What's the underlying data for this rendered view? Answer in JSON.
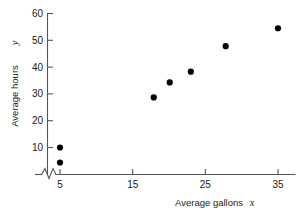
{
  "chart_data": {
    "type": "scatter",
    "title": "",
    "xlabel": "Average gallons",
    "xlabel_var": "x",
    "ylabel": "Average hours",
    "ylabel_var": "y",
    "xlim": [
      2.5,
      37
    ],
    "ylim": [
      0,
      62
    ],
    "xticks": [
      5,
      15,
      25,
      35
    ],
    "xticklabels": [
      "5",
      "15",
      "25",
      "35"
    ],
    "yticks": [
      10,
      20,
      30,
      40,
      50,
      60
    ],
    "yticklabels": [
      "10",
      "20",
      "30",
      "40",
      "50",
      "60"
    ],
    "grid": false,
    "legend": null,
    "axis_break": {
      "axis": "x",
      "symbol": "zigzag",
      "note": "break between origin and first tick"
    },
    "marker": {
      "shape": "circle",
      "color": "#000000",
      "size": 3.1
    },
    "points": [
      {
        "x": 5,
        "y": 4.4
      },
      {
        "x": 5,
        "y": 10.0
      },
      {
        "x": 17.9,
        "y": 28.7
      },
      {
        "x": 20.1,
        "y": 34.3
      },
      {
        "x": 23.0,
        "y": 38.3
      },
      {
        "x": 27.8,
        "y": 47.8
      },
      {
        "x": 35.0,
        "y": 54.5
      }
    ]
  },
  "colors": {
    "axis": "#555555",
    "text": "#1a1a1a",
    "marker": "#000000",
    "background": "#ffffff"
  }
}
